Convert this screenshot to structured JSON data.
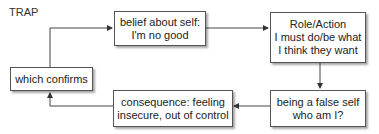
{
  "diagram": {
    "title": "TRAP",
    "nodes": [
      {
        "id": "which-confirms",
        "lines": [
          "which confirms"
        ]
      },
      {
        "id": "belief",
        "lines": [
          "belief about self:",
          "I'm no good"
        ]
      },
      {
        "id": "role-action",
        "lines": [
          "Role/Action",
          "I must do/be what",
          "I think they want"
        ]
      },
      {
        "id": "false-self",
        "lines": [
          "being a false self",
          "who am I?"
        ]
      },
      {
        "id": "consequence",
        "lines": [
          "consequence: feeling",
          "insecure, out of control"
        ]
      }
    ],
    "edges": [
      {
        "from": "which-confirms",
        "to": "belief"
      },
      {
        "from": "belief",
        "to": "role-action"
      },
      {
        "from": "role-action",
        "to": "false-self"
      },
      {
        "from": "false-self",
        "to": "consequence"
      },
      {
        "from": "consequence",
        "to": "which-confirms"
      }
    ],
    "colors": {
      "line": "#444444",
      "border": "#555555",
      "background": "#ffffff"
    }
  }
}
